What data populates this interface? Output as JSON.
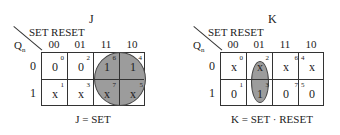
{
  "maps": [
    {
      "title": "J",
      "col_variable_label": "SET RESET",
      "row_variable_label": "Qn",
      "columns": [
        "00",
        "01",
        "11",
        "10"
      ],
      "rows": [
        "0",
        "1"
      ],
      "cells": [
        [
          {
            "value": "0",
            "index": "0"
          },
          {
            "value": "0",
            "index": "2"
          },
          {
            "value": "1",
            "index": "6"
          },
          {
            "value": "1",
            "index": "4"
          }
        ],
        [
          {
            "value": "x",
            "index": "1"
          },
          {
            "value": "x",
            "index": "3"
          },
          {
            "value": "x",
            "index": "7"
          },
          {
            "value": "x",
            "index": "5"
          }
        ]
      ],
      "grouping": "circle covering columns 11 and 10, both rows",
      "formula": "J = SET"
    },
    {
      "title": "K",
      "col_variable_label": "SET RESET",
      "row_variable_label": "Qn",
      "columns": [
        "00",
        "01",
        "11",
        "10"
      ],
      "rows": [
        "0",
        "1"
      ],
      "cells": [
        [
          {
            "value": "x",
            "index": "0"
          },
          {
            "value": "x",
            "index": "2"
          },
          {
            "value": "x",
            "index": "6"
          },
          {
            "value": "x",
            "index": "4"
          }
        ],
        [
          {
            "value": "0",
            "index": "1"
          },
          {
            "value": "1",
            "index": "3"
          },
          {
            "value": "0",
            "index": "7"
          },
          {
            "value": "0",
            "index": "5"
          }
        ]
      ],
      "grouping": "ellipse covering column 01, both rows",
      "formula": "K = SET · RESET"
    }
  ],
  "colors": {
    "group_fill": "#9c9c9c",
    "line": "#333333"
  }
}
